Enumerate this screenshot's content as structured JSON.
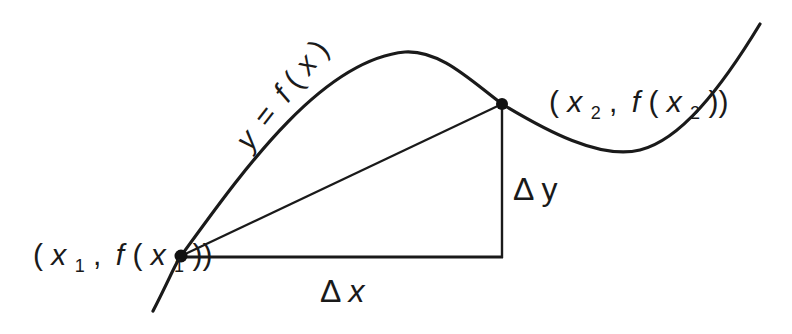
{
  "curve": {
    "label": "y = f(x)",
    "path": "M 153 311 C 170 278, 176 262, 181 256 C 240 175, 320 60, 405 52 C 440 50, 470 80, 502 104 C 545 130, 600 160, 640 150 C 680 140, 720 90, 760 24",
    "color": "#1a1a1a",
    "stroke_width": 3.2
  },
  "points": [
    {
      "id": "p1",
      "label": "(x1, f(x1))",
      "x": 181,
      "y": 256
    },
    {
      "id": "p2",
      "label": "(x2, f(x2))",
      "x": 502,
      "y": 104
    }
  ],
  "labels": {
    "curve_eq": {
      "y": "y",
      "eq": "=",
      "f": "f",
      "open": "(",
      "x": "x",
      "close": ")"
    },
    "p1": {
      "open": "(",
      "x": "x",
      "sub": "1",
      "comma": ",",
      "f": "f",
      "open2": "(",
      "x2": "x",
      "sub2": "1",
      "close": "))"
    },
    "p2": {
      "open": "(",
      "x": "x",
      "sub": "2",
      "comma": ",",
      "f": "f",
      "open2": "(",
      "x2": "x",
      "sub2": "2",
      "close": "))"
    },
    "delta_x": {
      "delta": "Δ",
      "var": "x"
    },
    "delta_y": {
      "delta": "Δ",
      "var": "y"
    }
  },
  "segments": {
    "secant": {
      "x1": 181,
      "y1": 256,
      "x2": 502,
      "y2": 104
    },
    "horizontal_run": {
      "x1": 181,
      "y1": 257,
      "x2": 502,
      "y2": 257
    },
    "vertical_rise": {
      "x1": 502,
      "y1": 104,
      "x2": 502,
      "y2": 257
    }
  }
}
